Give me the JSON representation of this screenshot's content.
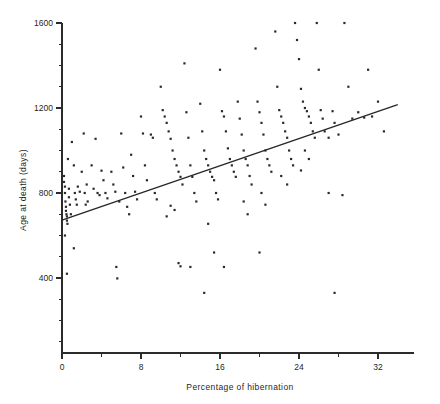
{
  "chart_data": {
    "type": "scatter",
    "title": "",
    "xlabel": "Percentage of hibernation",
    "ylabel": "Age at death (days)",
    "xlim": [
      0,
      34.5
    ],
    "ylim": [
      0,
      1600
    ],
    "grid": false,
    "legend": null,
    "x_ticks_major": [
      0,
      8,
      16,
      24,
      32
    ],
    "x_ticklabels": [
      "0",
      "8",
      "16",
      "24",
      "32"
    ],
    "x_ticks_minor": [
      4,
      12,
      20,
      28
    ],
    "y_ticks_major": [
      400,
      800,
      1200,
      1600
    ],
    "y_ticklabels": [
      "400",
      "800",
      "1200",
      "1600"
    ],
    "y_ticks_minor": [
      0,
      100,
      200,
      300,
      500,
      600,
      700,
      900,
      1000,
      1100,
      1300,
      1400,
      1500
    ],
    "marker": "small-square",
    "marker_color": "#2a2a2a",
    "fit_line": {
      "label": "linear regression",
      "x_start": 0,
      "y_start": 672,
      "x_end": 34,
      "y_end": 1216,
      "color": "#262626"
    },
    "points": [
      [
        0.2,
        880
      ],
      [
        0.2,
        852
      ],
      [
        0.3,
        830
      ],
      [
        0.3,
        800
      ],
      [
        0.35,
        760
      ],
      [
        0.4,
        735
      ],
      [
        0.4,
        716
      ],
      [
        0.45,
        700
      ],
      [
        0.5,
        690
      ],
      [
        0.5,
        670
      ],
      [
        0.55,
        655
      ],
      [
        0.3,
        600
      ],
      [
        0.6,
        960
      ],
      [
        0.7,
        820
      ],
      [
        0.7,
        780
      ],
      [
        0.8,
        745
      ],
      [
        0.9,
        700
      ],
      [
        0.5,
        420
      ],
      [
        1.0,
        1040
      ],
      [
        1.2,
        930
      ],
      [
        1.3,
        800
      ],
      [
        1.4,
        770
      ],
      [
        1.5,
        745
      ],
      [
        1.2,
        540
      ],
      [
        1.6,
        830
      ],
      [
        1.8,
        806
      ],
      [
        2.0,
        900
      ],
      [
        2.2,
        1080
      ],
      [
        2.3,
        800
      ],
      [
        2.5,
        840
      ],
      [
        2.6,
        760
      ],
      [
        2.4,
        745
      ],
      [
        3.0,
        930
      ],
      [
        3.2,
        820
      ],
      [
        3.4,
        1055
      ],
      [
        3.6,
        800
      ],
      [
        3.8,
        790
      ],
      [
        4.0,
        905
      ],
      [
        4.2,
        860
      ],
      [
        4.4,
        800
      ],
      [
        4.6,
        775
      ],
      [
        5.0,
        900
      ],
      [
        5.2,
        840
      ],
      [
        5.4,
        806
      ],
      [
        5.8,
        760
      ],
      [
        6.0,
        1080
      ],
      [
        6.2,
        920
      ],
      [
        6.4,
        800
      ],
      [
        6.6,
        735
      ],
      [
        6.8,
        700
      ],
      [
        5.5,
        452
      ],
      [
        5.6,
        398
      ],
      [
        7.0,
        980
      ],
      [
        7.2,
        880
      ],
      [
        7.4,
        806
      ],
      [
        7.6,
        770
      ],
      [
        8.0,
        1160
      ],
      [
        8.2,
        1080
      ],
      [
        8.4,
        930
      ],
      [
        8.6,
        860
      ],
      [
        9.0,
        1075
      ],
      [
        9.2,
        1060
      ],
      [
        9.4,
        800
      ],
      [
        9.6,
        770
      ],
      [
        10.0,
        1300
      ],
      [
        10.2,
        1190
      ],
      [
        10.4,
        1160
      ],
      [
        10.6,
        1130
      ],
      [
        10.8,
        1090
      ],
      [
        11.0,
        1055
      ],
      [
        11.2,
        1000
      ],
      [
        11.4,
        960
      ],
      [
        11.6,
        930
      ],
      [
        11.8,
        900
      ],
      [
        12.0,
        876
      ],
      [
        12.2,
        840
      ],
      [
        11.0,
        740
      ],
      [
        11.4,
        720
      ],
      [
        10.6,
        690
      ],
      [
        11.8,
        470
      ],
      [
        12.4,
        1410
      ],
      [
        12.6,
        1180
      ],
      [
        12.8,
        1060
      ],
      [
        13.0,
        930
      ],
      [
        13.2,
        876
      ],
      [
        13.4,
        800
      ],
      [
        13.6,
        760
      ],
      [
        12.0,
        455
      ],
      [
        13.0,
        452
      ],
      [
        14.0,
        1220
      ],
      [
        14.2,
        1090
      ],
      [
        14.4,
        1000
      ],
      [
        14.6,
        960
      ],
      [
        14.8,
        930
      ],
      [
        15.0,
        900
      ],
      [
        15.2,
        876
      ],
      [
        15.4,
        860
      ],
      [
        15.6,
        800
      ],
      [
        15.8,
        770
      ],
      [
        14.8,
        655
      ],
      [
        15.4,
        520
      ],
      [
        14.4,
        330
      ],
      [
        16.0,
        1380
      ],
      [
        16.2,
        1185
      ],
      [
        16.4,
        1160
      ],
      [
        16.6,
        1090
      ],
      [
        16.8,
        1010
      ],
      [
        17.0,
        960
      ],
      [
        17.2,
        930
      ],
      [
        17.4,
        900
      ],
      [
        17.6,
        876
      ],
      [
        16.4,
        452
      ],
      [
        17.8,
        1230
      ],
      [
        18.0,
        1150
      ],
      [
        18.2,
        1075
      ],
      [
        18.4,
        1000
      ],
      [
        18.6,
        960
      ],
      [
        18.8,
        930
      ],
      [
        19.0,
        880
      ],
      [
        19.2,
        840
      ],
      [
        18.4,
        760
      ],
      [
        18.8,
        700
      ],
      [
        19.6,
        1480
      ],
      [
        19.8,
        1230
      ],
      [
        20.0,
        1180
      ],
      [
        20.2,
        1130
      ],
      [
        20.4,
        1075
      ],
      [
        20.6,
        1000
      ],
      [
        20.8,
        960
      ],
      [
        21.0,
        930
      ],
      [
        21.2,
        900
      ],
      [
        20.2,
        800
      ],
      [
        20.6,
        745
      ],
      [
        20.0,
        520
      ],
      [
        21.6,
        1560
      ],
      [
        21.8,
        1300
      ],
      [
        22.0,
        1190
      ],
      [
        22.2,
        1160
      ],
      [
        22.4,
        1130
      ],
      [
        22.6,
        1090
      ],
      [
        22.8,
        1060
      ],
      [
        23.0,
        1000
      ],
      [
        23.2,
        960
      ],
      [
        23.4,
        930
      ],
      [
        22.2,
        880
      ],
      [
        22.8,
        840
      ],
      [
        23.6,
        1600
      ],
      [
        23.8,
        1520
      ],
      [
        24.0,
        1430
      ],
      [
        24.2,
        1290
      ],
      [
        24.4,
        1230
      ],
      [
        24.6,
        1200
      ],
      [
        24.8,
        1185
      ],
      [
        25.0,
        1160
      ],
      [
        25.2,
        1130
      ],
      [
        25.4,
        1090
      ],
      [
        25.6,
        1060
      ],
      [
        24.6,
        1000
      ],
      [
        25.0,
        960
      ],
      [
        24.2,
        906
      ],
      [
        25.8,
        1600
      ],
      [
        26.0,
        1380
      ],
      [
        26.2,
        1190
      ],
      [
        26.4,
        1150
      ],
      [
        26.6,
        1090
      ],
      [
        27.0,
        1060
      ],
      [
        27.4,
        1185
      ],
      [
        27.6,
        1130
      ],
      [
        28.0,
        1075
      ],
      [
        27.0,
        800
      ],
      [
        28.6,
        1600
      ],
      [
        29.0,
        1300
      ],
      [
        29.4,
        1150
      ],
      [
        28.4,
        790
      ],
      [
        27.6,
        330
      ],
      [
        30.0,
        1180
      ],
      [
        30.6,
        1155
      ],
      [
        31.0,
        1380
      ],
      [
        32.0,
        1230
      ],
      [
        32.6,
        1090
      ],
      [
        31.4,
        1160
      ]
    ]
  },
  "figure": {
    "background_color": "#ffffff",
    "axis_color": "#2b2b2b"
  }
}
